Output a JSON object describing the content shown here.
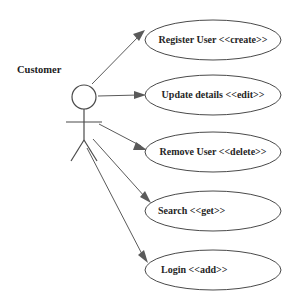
{
  "diagram": {
    "type": "uml-use-case-diagram",
    "background_color": "#ffffff",
    "stroke_color": "#4a4a4a",
    "text_color": "#262626",
    "actor": {
      "name": "Customer",
      "label": "Customer",
      "icon": "stick-figure-actor-icon"
    },
    "use_cases": [
      {
        "id": "register-user",
        "label": "Register User <<create>>",
        "stereotype": "create",
        "text_anchor": "middle",
        "cx": 213,
        "cy": 40,
        "rx": 68,
        "ry": 20,
        "label_x": 213,
        "label_y": 43
      },
      {
        "id": "update-details",
        "label": "Update details <<edit>>",
        "stereotype": "edit",
        "text_anchor": "middle",
        "cx": 213,
        "cy": 95,
        "rx": 68,
        "ry": 20,
        "label_x": 213,
        "label_y": 98
      },
      {
        "id": "remove-user",
        "label": "Remove User <<delete>>",
        "stereotype": "delete",
        "text_anchor": "middle",
        "cx": 213,
        "cy": 152,
        "rx": 68,
        "ry": 20,
        "label_x": 213,
        "label_y": 155
      },
      {
        "id": "search",
        "label": "Search <<get>>",
        "stereotype": "get",
        "text_anchor": "start",
        "cx": 213,
        "cy": 211,
        "rx": 68,
        "ry": 20,
        "label_x": 158,
        "label_y": 214
      },
      {
        "id": "login",
        "label": "Login <<add>>",
        "stereotype": "add",
        "text_anchor": "start",
        "cx": 213,
        "cy": 270,
        "rx": 68,
        "ry": 20,
        "label_x": 161,
        "label_y": 273
      }
    ],
    "associations": [
      {
        "id": "customer-to-register-user",
        "from": "Customer",
        "to": "Register User <<create>>"
      },
      {
        "id": "customer-to-update-details",
        "from": "Customer",
        "to": "Update details <<edit>>"
      },
      {
        "id": "customer-to-remove-user",
        "from": "Customer",
        "to": "Remove User <<delete>>"
      },
      {
        "id": "customer-to-search",
        "from": "Customer",
        "to": "Search <<get>>"
      },
      {
        "id": "customer-to-login",
        "from": "Customer",
        "to": "Login <<add>>"
      }
    ]
  }
}
